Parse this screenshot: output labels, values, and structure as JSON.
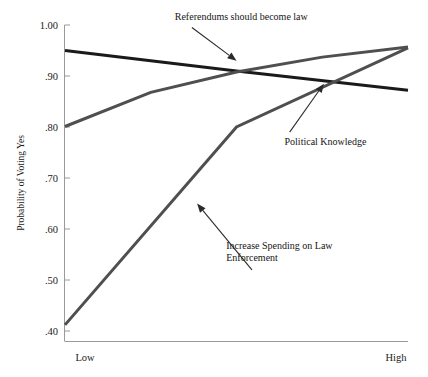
{
  "chart_data": {
    "type": "line",
    "title": "",
    "xlabel": "",
    "ylabel": "Probability of Voting Yes",
    "x": [
      0,
      1
    ],
    "x_tick_labels": [
      "Low",
      "High"
    ],
    "xlim": [
      0,
      1
    ],
    "ylim": [
      0.4,
      1.0
    ],
    "y_tick_labels": [
      "1.00",
      ".90",
      ".80",
      ".70",
      ".60",
      ".50",
      ".40"
    ],
    "y_ticks": [
      1.0,
      0.9,
      0.8,
      0.7,
      0.6,
      0.5,
      0.4
    ],
    "grid": false,
    "legend": "annotations-on-plot",
    "series": [
      {
        "name": "Referendums should become law",
        "color": "#1a1a1a",
        "linewidth": 3.0,
        "points": [
          {
            "x": 0.0,
            "y": 0.95
          },
          {
            "x": 0.5,
            "y": 0.91
          },
          {
            "x": 1.0,
            "y": 0.872
          }
        ]
      },
      {
        "name": "Political Knowledge",
        "color": "#4f4f4f",
        "linewidth": 3.0,
        "points": [
          {
            "x": 0.0,
            "y": 0.801
          },
          {
            "x": 0.25,
            "y": 0.868
          },
          {
            "x": 0.5,
            "y": 0.908
          },
          {
            "x": 0.75,
            "y": 0.937
          },
          {
            "x": 1.0,
            "y": 0.957
          }
        ]
      },
      {
        "name": "Increase Spending on Law Enforcement",
        "color": "#4f4f4f",
        "linewidth": 3.0,
        "points": [
          {
            "x": 0.0,
            "y": 0.412
          },
          {
            "x": 0.5,
            "y": 0.8
          },
          {
            "x": 1.0,
            "y": 0.955
          }
        ]
      }
    ],
    "annotations": [
      {
        "name": "referendums-annotation",
        "text_lines": [
          "Referendums should become law"
        ],
        "text_x": 0.32,
        "text_y": 1.01,
        "arrow_from": {
          "x": 0.37,
          "y": 0.995
        },
        "arrow_to": {
          "x": 0.5,
          "y": 0.93
        }
      },
      {
        "name": "political-knowledge-annotation",
        "text_lines": [
          "Political Knowledge"
        ],
        "text_x": 0.64,
        "text_y": 0.765,
        "arrow_from": {
          "x": 0.655,
          "y": 0.79
        },
        "arrow_to": {
          "x": 0.755,
          "y": 0.885
        }
      },
      {
        "name": "increase-spending-annotation",
        "text_lines": [
          "Increase Spending on Law",
          "Enforcement"
        ],
        "text_x": 0.47,
        "text_y": 0.56,
        "arrow_from": {
          "x": 0.545,
          "y": 0.52
        },
        "arrow_to": {
          "x": 0.385,
          "y": 0.65
        }
      }
    ]
  }
}
